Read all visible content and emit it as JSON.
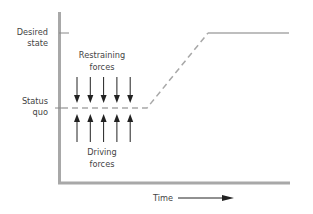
{
  "diagram": {
    "y_labels": {
      "desired_state": [
        "Desired",
        "state"
      ],
      "status_quo": [
        "Status",
        "quo"
      ]
    },
    "restraining_label": [
      "Restraining",
      "forces"
    ],
    "driving_label": [
      "Driving",
      "forces"
    ],
    "x_label": "Time",
    "arrow_count": {
      "restraining": 5,
      "driving": 5
    },
    "colors": {
      "axis": "#a8a8a8",
      "line": "#a8a8a8",
      "arrow": "#222222",
      "text": "#444444"
    }
  }
}
